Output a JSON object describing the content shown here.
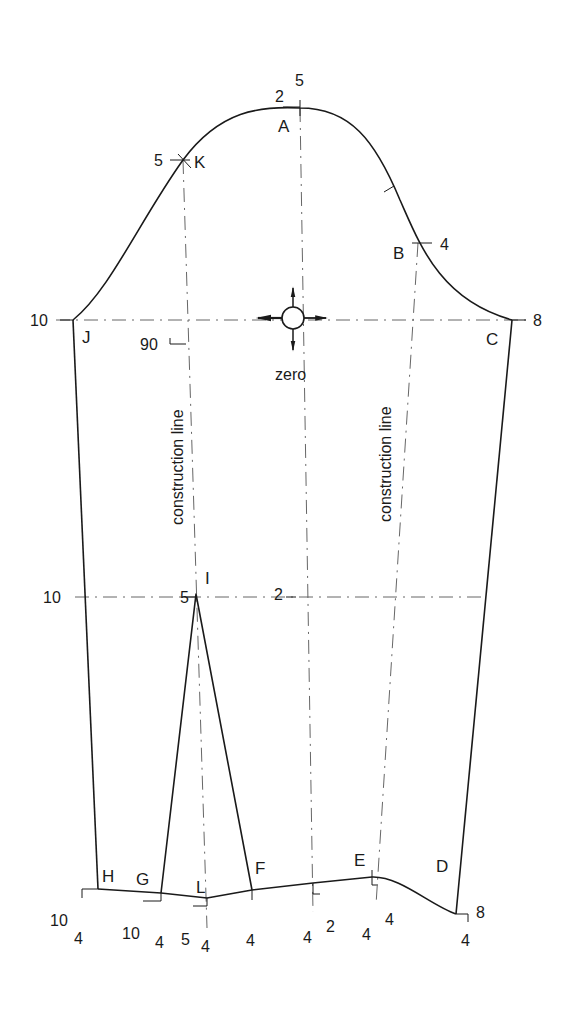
{
  "diagram": {
    "type": "sleeve pattern draft",
    "points": {
      "A": "A",
      "B": "B",
      "C": "C",
      "D": "D",
      "E": "E",
      "F": "F",
      "G": "G",
      "H": "H",
      "I": "I",
      "J": "J",
      "K": "K",
      "L": "L"
    },
    "measurements": {
      "a_left": "2",
      "a_top": "5",
      "k_left": "5",
      "b_right": "4",
      "j_left": "10",
      "c_right": "8",
      "right_angle": "90",
      "elbow_left": "10",
      "i_left": "5",
      "center_elbow": "2",
      "h_left": "10",
      "h_below": "4",
      "g_left": "10",
      "g_below": "4",
      "l_left": "5",
      "l_below": "4",
      "f_below": "4",
      "center_hem_below": "4",
      "center_hem_right": "2",
      "e_below": "4",
      "e_right": "4",
      "d_right": "8",
      "d_below": "4"
    },
    "annotations": {
      "zero": "zero",
      "construction_left": "construction line",
      "construction_right": "construction line"
    },
    "colors": {
      "ink": "#1a1a1a",
      "background": "#ffffff"
    }
  }
}
